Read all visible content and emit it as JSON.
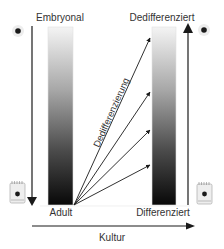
{
  "diagram": {
    "left_column": {
      "top_label": "Embryonal",
      "bottom_label": "Adult",
      "gradient": [
        "#f2f2f2",
        "#0a0a0a"
      ]
    },
    "right_column": {
      "top_label": "Dedifferenziert",
      "bottom_label": "Differenziert",
      "gradient": [
        "#f2f2f2",
        "#0a0a0a"
      ]
    },
    "diagonal_label": "Dedifferenzierung",
    "horizontal_axis_label": "Kultur",
    "icons": {
      "top_left": "cell-nucleus-icon",
      "top_right": "cell-nucleus-icon",
      "bottom_left": "culture-dish-icon",
      "bottom_right": "culture-dish-icon"
    },
    "arrows": {
      "left_vertical": "down",
      "right_vertical": "up",
      "horizontal": "right",
      "diverging_count": 4
    },
    "colors": {
      "line": "#1a1a1a",
      "text": "#333333"
    }
  }
}
